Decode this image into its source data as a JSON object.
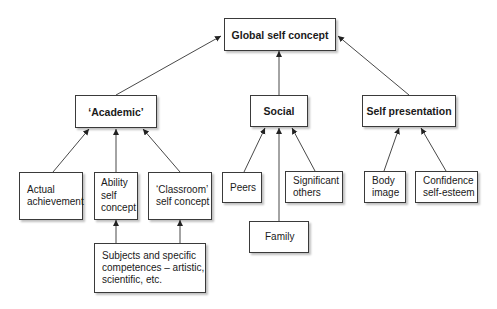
{
  "diagram": {
    "root": {
      "label": "Global self concept"
    },
    "categories": [
      {
        "label": "‘Academic’"
      },
      {
        "label": "Social"
      },
      {
        "label": "Self presentation"
      }
    ],
    "academic_children": [
      {
        "line1": "Actual",
        "line2": "achievement"
      },
      {
        "line1": "Ability",
        "line2": "self",
        "line3": "concept"
      },
      {
        "line1": "‘Classroom’",
        "line2": "self concept"
      }
    ],
    "social_children": [
      {
        "line1": "Peers"
      },
      {
        "line1": "Family"
      },
      {
        "line1": "Significant",
        "line2": "others"
      }
    ],
    "self_presentation_children": [
      {
        "line1": "Body",
        "line2": "image"
      },
      {
        "line1": "Confidence",
        "line2": "self-esteem"
      }
    ],
    "subjects": {
      "line1": "Subjects and specific",
      "line2": "competences – artistic,",
      "line3": "scientific, etc."
    }
  }
}
